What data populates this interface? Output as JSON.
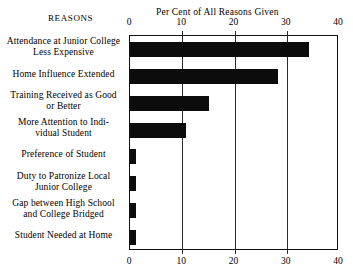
{
  "header": {
    "reasons_label": "Reasons",
    "title": "Per Cent of All Reasons Given"
  },
  "chart_data": {
    "type": "bar",
    "orientation": "horizontal",
    "title": "Per Cent of All Reasons Given",
    "xlabel": "Per Cent of All Reasons Given",
    "ylabel": "Reasons",
    "xlim": [
      0,
      40
    ],
    "xticks": [
      0,
      10,
      20,
      30,
      40
    ],
    "xtick_labels": [
      "0",
      "10",
      "20",
      "30",
      "40"
    ],
    "grid": true,
    "legend": "none",
    "bar_color": "#0c0c0c",
    "categories": [
      "Attendance at Junior College\nLess Expensive",
      "Home Influence Extended",
      "Training Received as Good\nor Better",
      "More Attention to Indi-\nvidual Student",
      "Preference of Student",
      "Duty to Patronize Local\nJunior College",
      "Gap between High School\nand College Bridged",
      "Student Needed at Home"
    ],
    "values": [
      34.3,
      28.4,
      15.1,
      10.7,
      1.2,
      1.2,
      1.2,
      1.2
    ]
  }
}
